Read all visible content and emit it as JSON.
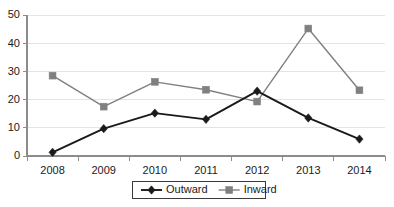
{
  "chart_data": {
    "type": "line",
    "title": "",
    "subtitle": "",
    "xlabel": "",
    "ylabel": "",
    "categories": [
      "2008",
      "2009",
      "2010",
      "2011",
      "2012",
      "2013",
      "2014"
    ],
    "series": [
      {
        "name": "Outward",
        "color": "#1a1a1a",
        "marker": "diamond",
        "values": [
          1.3,
          9.7,
          15.2,
          13.0,
          23.0,
          13.5,
          6.0
        ]
      },
      {
        "name": "Inward",
        "color": "#808080",
        "marker": "square",
        "values": [
          28.5,
          17.5,
          26.3,
          23.5,
          19.3,
          45.2,
          23.3
        ]
      }
    ],
    "ylim": [
      0,
      50
    ],
    "yticks": [
      0,
      10,
      20,
      30,
      40,
      50
    ],
    "ytick_labels": [
      "0",
      "10",
      "20",
      "30",
      "40",
      "50"
    ],
    "grid": true,
    "grid_axis": "y",
    "legend_position": "bottom",
    "legend_entries": [
      {
        "label": "Outward",
        "color": "#1a1a1a",
        "marker": "diamond"
      },
      {
        "label": "Inward",
        "color": "#808080",
        "marker": "square"
      }
    ]
  },
  "colors": {
    "outward": "#1a1a1a",
    "inward": "#808080",
    "gridline": "#e4e4e4",
    "axis": "#8c8c8c",
    "background": "#ffffff",
    "text": "#1a1a1a"
  }
}
